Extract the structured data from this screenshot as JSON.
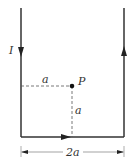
{
  "diagram": {
    "current_label": "I",
    "point_label": "P",
    "horizontal_distance_label": "a",
    "vertical_distance_label": "a",
    "width_label": "2a",
    "colors": {
      "wire": "#333333",
      "dashed": "#555555",
      "background": "#ffffff"
    }
  }
}
